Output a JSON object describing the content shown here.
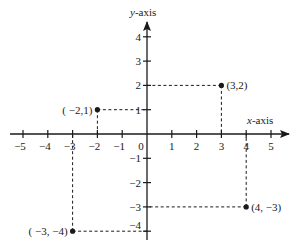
{
  "chart_data": {
    "type": "scatter",
    "title": "",
    "xlabel_var": "x",
    "xlabel_rest": "-axis",
    "ylabel_var": "y",
    "ylabel_rest": "-axis",
    "xlim": [
      -5,
      5
    ],
    "ylim": [
      -4,
      4
    ],
    "grid": false,
    "x_ticks": [
      -5,
      -4,
      -3,
      -2,
      -1,
      1,
      2,
      3,
      4,
      5
    ],
    "x_tick_labels": [
      "−5",
      "−4",
      "−3",
      "−2",
      "−1",
      "1",
      "2",
      "3",
      "4",
      "5"
    ],
    "y_ticks": [
      4,
      3,
      2,
      1,
      -1,
      -2,
      -3,
      -4
    ],
    "y_tick_labels": [
      "4",
      "3",
      "2",
      "1",
      "−1",
      "−2",
      "−3",
      "−4"
    ],
    "origin_label": "0",
    "points": [
      {
        "x": 3,
        "y": 2,
        "label": "(3,2)",
        "label_pos": "right"
      },
      {
        "x": -2,
        "y": 1,
        "label": "( −2,1)",
        "label_pos": "left"
      },
      {
        "x": -3,
        "y": -4,
        "label": "( −3,  −4)",
        "label_pos": "left"
      },
      {
        "x": 4,
        "y": -3,
        "label": "(4,  −3)",
        "label_pos": "right"
      }
    ],
    "projection_lines": "dashed",
    "colors": {
      "ink": "#1a1a1a",
      "background": "#ffffff"
    }
  }
}
